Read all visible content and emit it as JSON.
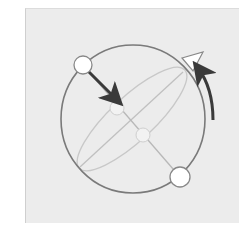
{
  "diagram": {
    "colors": {
      "background": "#ececec",
      "sphere_outline": "#7a7a7a",
      "guide_lines": "#c4c4c4",
      "arrow": "#3a3a3a",
      "node_fill": "#ffffff",
      "node_stroke": "#888888"
    },
    "elements": [
      {
        "type": "sphere",
        "icon": "sphere-outline"
      },
      {
        "type": "node",
        "position": "top-left"
      },
      {
        "type": "node",
        "position": "bottom-right"
      },
      {
        "type": "arrow",
        "direction": "down-right",
        "icon": "straight-arrow"
      },
      {
        "type": "arrow",
        "direction": "curved-up",
        "icon": "curved-arrow"
      },
      {
        "type": "marker",
        "shape": "triangle",
        "position": "top-right"
      }
    ]
  }
}
